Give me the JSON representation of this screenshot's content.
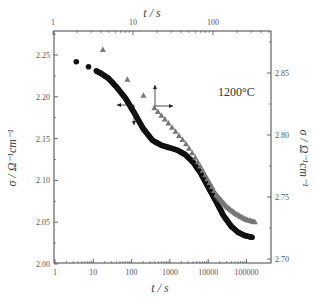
{
  "chart_data": {
    "type": "scatter",
    "title": "",
    "annotation": "1200°C",
    "bottom_axis": {
      "label": "t / s",
      "scale": "log",
      "range": [
        1,
        200000
      ],
      "ticks": [
        "1",
        "10",
        "100",
        "1000",
        "10000",
        "100000"
      ]
    },
    "top_axis": {
      "label": "t / s",
      "scale": "log",
      "range": [
        1,
        500
      ],
      "ticks": [
        "1",
        "10",
        "100"
      ]
    },
    "left_axis": {
      "label": "σ / Ω⁻¹cm⁻¹",
      "range": [
        2.0,
        2.27
      ],
      "ticks": [
        "2.00",
        "2.05",
        "2.10",
        "2.15",
        "2.20",
        "2.25"
      ]
    },
    "right_axis": {
      "label": "σ / Ω⁻¹cm⁻¹",
      "range": [
        2.7,
        2.87
      ],
      "ticks": [
        "2.70",
        "2.75",
        "2.80",
        "2.85"
      ]
    },
    "series": [
      {
        "name": "circles (left / bottom axes)",
        "marker": "circle",
        "color": "#111111",
        "x": [
          3.6,
          7.5,
          12,
          16,
          25,
          40,
          70,
          120,
          200,
          350,
          600,
          1000,
          1600,
          2500,
          4000,
          6500,
          10000,
          16000,
          25000,
          40000,
          60000,
          90000,
          140000
        ],
        "y": [
          2.242,
          2.236,
          2.231,
          2.228,
          2.222,
          2.212,
          2.198,
          2.18,
          2.162,
          2.148,
          2.142,
          2.139,
          2.136,
          2.131,
          2.122,
          2.108,
          2.092,
          2.075,
          2.058,
          2.045,
          2.038,
          2.034,
          2.032
        ]
      },
      {
        "name": "triangles (right / top axes)",
        "marker": "triangle",
        "color": "#777777",
        "x": [
          4.2,
          8.5,
          13.5,
          18.5,
          25,
          34,
          46,
          60,
          80,
          110,
          150,
          200,
          260,
          334
        ],
        "y": [
          2.869,
          2.845,
          2.832,
          2.822,
          2.813,
          2.803,
          2.793,
          2.782,
          2.768,
          2.752,
          2.742,
          2.736,
          2.732,
          2.73
        ]
      }
    ],
    "arrows": [
      {
        "for": "circles",
        "direction": "left and down"
      },
      {
        "for": "triangles",
        "direction": "up and right"
      }
    ],
    "grid": false,
    "legend": "none"
  },
  "labels": {
    "bottom_title": "t / s",
    "top_title": "t / s",
    "left_title": "σ / Ω⁻¹cm⁻¹",
    "right_title": "σ / Ω⁻¹cm⁻¹",
    "temperature": "1200°C"
  }
}
